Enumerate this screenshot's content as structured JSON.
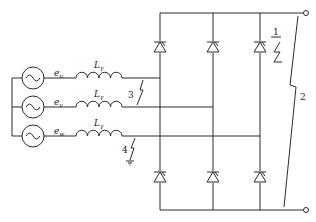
{
  "diagram": {
    "type": "circuit-schematic",
    "sources": [
      {
        "id": "u",
        "label": "e",
        "subscript": "u"
      },
      {
        "id": "v",
        "label": "e",
        "subscript": "v"
      },
      {
        "id": "w",
        "label": "e",
        "subscript": "w"
      }
    ],
    "inductors": [
      {
        "phase": "u",
        "label": "L",
        "subscript": "γ"
      },
      {
        "phase": "v",
        "label": "L",
        "subscript": "γ"
      },
      {
        "phase": "w",
        "label": "L",
        "subscript": "γ"
      }
    ],
    "thyristors": {
      "upper": [
        "T1",
        "T3",
        "T5"
      ],
      "lower": [
        "T4",
        "T6",
        "T2"
      ]
    },
    "fault_labels": [
      {
        "id": "1",
        "text": "1",
        "location": "across upper thyristor (phase w leg)"
      },
      {
        "id": "2",
        "text": "2",
        "location": "across DC output terminals"
      },
      {
        "id": "3",
        "text": "3",
        "location": "line-to-line between phases u and v"
      },
      {
        "id": "4",
        "text": "4",
        "location": "phase w to ground"
      }
    ],
    "terminals": [
      "dc-positive",
      "dc-negative"
    ],
    "colors": {
      "line": "#2b2b2b",
      "background": "#ffffff"
    }
  }
}
